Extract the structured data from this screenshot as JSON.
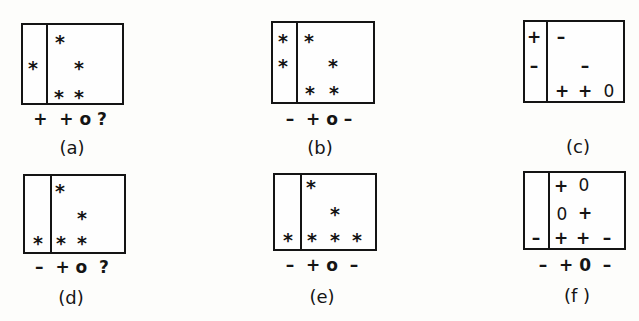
{
  "figure": {
    "panels": [
      {
        "id": "a",
        "caption": "(a)",
        "column_labels": "+  + o ?",
        "left_column": [
          {
            "row": 2,
            "symbol": "*"
          }
        ],
        "grid": [
          {
            "row": 1,
            "col": 1,
            "symbol": "*"
          },
          {
            "row": 2,
            "col": 2,
            "symbol": "*"
          },
          {
            "row": 3,
            "col": 1,
            "symbol": "*"
          },
          {
            "row": 3,
            "col": 2,
            "symbol": "*"
          }
        ]
      },
      {
        "id": "b",
        "caption": "(b)",
        "column_labels": "–  + o –",
        "left_column": [
          {
            "row": 1,
            "symbol": "*"
          },
          {
            "row": 2,
            "symbol": "*"
          }
        ],
        "grid": [
          {
            "row": 1,
            "col": 1,
            "symbol": "*"
          },
          {
            "row": 2,
            "col": 2,
            "symbol": "*"
          },
          {
            "row": 3,
            "col": 1,
            "symbol": "*"
          },
          {
            "row": 3,
            "col": 2,
            "symbol": "*"
          }
        ]
      },
      {
        "id": "c",
        "caption": "(c)",
        "column_labels": "",
        "left_column": [
          {
            "row": 1,
            "symbol": "+"
          },
          {
            "row": 2,
            "symbol": "–"
          }
        ],
        "grid": [
          {
            "row": 1,
            "col": 1,
            "symbol": "–"
          },
          {
            "row": 2,
            "col": 2,
            "symbol": "–"
          },
          {
            "row": 3,
            "col": 1,
            "symbol": "+"
          },
          {
            "row": 3,
            "col": 2,
            "symbol": "+"
          },
          {
            "row": 3,
            "col": 3,
            "symbol": "0"
          }
        ]
      },
      {
        "id": "d",
        "caption": "(d)",
        "column_labels": "–  + o  ?",
        "left_column": [
          {
            "row": 3,
            "symbol": "*"
          }
        ],
        "grid": [
          {
            "row": 1,
            "col": 1,
            "symbol": "*"
          },
          {
            "row": 2,
            "col": 2,
            "symbol": "*"
          },
          {
            "row": 3,
            "col": 1,
            "symbol": "*"
          },
          {
            "row": 3,
            "col": 2,
            "symbol": "*"
          }
        ]
      },
      {
        "id": "e",
        "caption": "(e)",
        "column_labels": "–  + o  –",
        "left_column": [
          {
            "row": 3,
            "symbol": "*"
          }
        ],
        "grid": [
          {
            "row": 1,
            "col": 1,
            "symbol": "*"
          },
          {
            "row": 2,
            "col": 2,
            "symbol": "*"
          },
          {
            "row": 3,
            "col": 1,
            "symbol": "*"
          },
          {
            "row": 3,
            "col": 2,
            "symbol": "*"
          },
          {
            "row": 3,
            "col": 3,
            "symbol": "*"
          }
        ]
      },
      {
        "id": "f",
        "caption": "(f )",
        "column_labels": "–  + 0  –",
        "left_column": [
          {
            "row": 3,
            "symbol": "–"
          }
        ],
        "grid": [
          {
            "row": 1,
            "col": 1,
            "symbol": "+"
          },
          {
            "row": 1,
            "col": 2,
            "symbol": "0"
          },
          {
            "row": 2,
            "col": 1,
            "symbol": "0"
          },
          {
            "row": 2,
            "col": 2,
            "symbol": "+"
          },
          {
            "row": 3,
            "col": 1,
            "symbol": "+"
          },
          {
            "row": 3,
            "col": 2,
            "symbol": "+"
          },
          {
            "row": 3,
            "col": 3,
            "symbol": "–"
          }
        ]
      }
    ]
  }
}
